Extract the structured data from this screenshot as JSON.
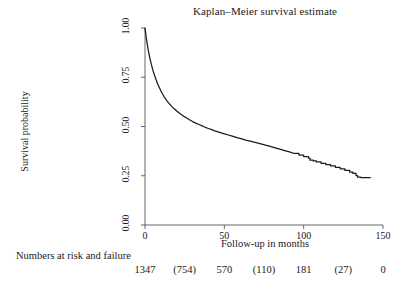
{
  "chart_data": {
    "type": "line",
    "title": "Kaplan–Meier survival estimate",
    "xlabel": "Follow-up in months",
    "ylabel": "Survival probability",
    "xlim": [
      0,
      150
    ],
    "ylim": [
      0,
      1.0
    ],
    "grid": false,
    "legend": "none",
    "xticks": [
      {
        "value": 0,
        "label": "0"
      },
      {
        "value": 50,
        "label": "50"
      },
      {
        "value": 100,
        "label": "100"
      },
      {
        "value": 150,
        "label": "150"
      }
    ],
    "yticks": [
      {
        "value": 0.0,
        "label": "0.00"
      },
      {
        "value": 0.25,
        "label": "0.25"
      },
      {
        "value": 0.5,
        "label": "0.50"
      },
      {
        "value": 0.75,
        "label": "0.75"
      },
      {
        "value": 1.0,
        "label": "1.00"
      }
    ],
    "series": [
      {
        "name": "Kaplan-Meier survival estimate",
        "color": "#1a1a1a",
        "x": [
          0,
          1,
          2,
          3,
          4,
          5,
          6,
          7,
          8,
          9,
          10,
          11,
          12,
          13,
          14,
          15,
          16,
          17,
          18,
          19,
          20,
          22,
          24,
          26,
          28,
          30,
          32,
          34,
          36,
          38,
          40,
          42,
          44,
          46,
          48,
          50,
          52,
          55,
          58,
          61,
          64,
          67,
          70,
          73,
          76,
          79,
          82,
          85,
          88,
          91,
          94,
          97,
          100,
          103,
          104,
          106,
          108,
          111,
          114,
          117,
          120,
          123,
          126,
          129,
          131,
          133,
          134,
          136,
          138,
          140,
          142
        ],
        "y": [
          1.0,
          0.94,
          0.89,
          0.85,
          0.815,
          0.785,
          0.76,
          0.737,
          0.716,
          0.698,
          0.681,
          0.666,
          0.652,
          0.64,
          0.629,
          0.619,
          0.61,
          0.601,
          0.593,
          0.586,
          0.579,
          0.566,
          0.554,
          0.544,
          0.534,
          0.525,
          0.517,
          0.51,
          0.503,
          0.496,
          0.49,
          0.484,
          0.478,
          0.473,
          0.468,
          0.463,
          0.458,
          0.451,
          0.444,
          0.437,
          0.43,
          0.424,
          0.418,
          0.412,
          0.405,
          0.399,
          0.392,
          0.385,
          0.378,
          0.371,
          0.363,
          0.355,
          0.347,
          0.34,
          0.329,
          0.325,
          0.32,
          0.313,
          0.306,
          0.3,
          0.293,
          0.285,
          0.277,
          0.268,
          0.262,
          0.251,
          0.243,
          0.241,
          0.24,
          0.24,
          0.24
        ]
      }
    ]
  },
  "risk_table": {
    "caption": "Numbers at risk and failure",
    "entries": [
      {
        "label": "1347",
        "x": 0
      },
      {
        "label": "(754)",
        "x": 25
      },
      {
        "label": "570",
        "x": 50
      },
      {
        "label": "(110)",
        "x": 75
      },
      {
        "label": "181",
        "x": 100
      },
      {
        "label": "(27)",
        "x": 125
      },
      {
        "label": "0",
        "x": 150
      }
    ]
  }
}
